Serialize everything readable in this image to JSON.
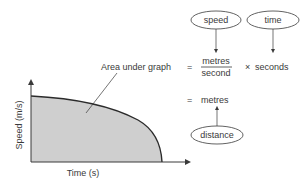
{
  "graph": {
    "y_axis_label": "Speed (m/s)",
    "x_axis_label": "Time (s)",
    "area_fill": "#cfcfcf",
    "curve_color": "#2b2b2b"
  },
  "equation": {
    "lhs": "Area under graph",
    "equals": "=",
    "numerator": "metres",
    "denominator": "second",
    "times": "×",
    "multiplier": "seconds",
    "result_equals": "=",
    "result": "metres"
  },
  "annotations": {
    "speed": "speed",
    "time": "time",
    "distance": "distance"
  }
}
